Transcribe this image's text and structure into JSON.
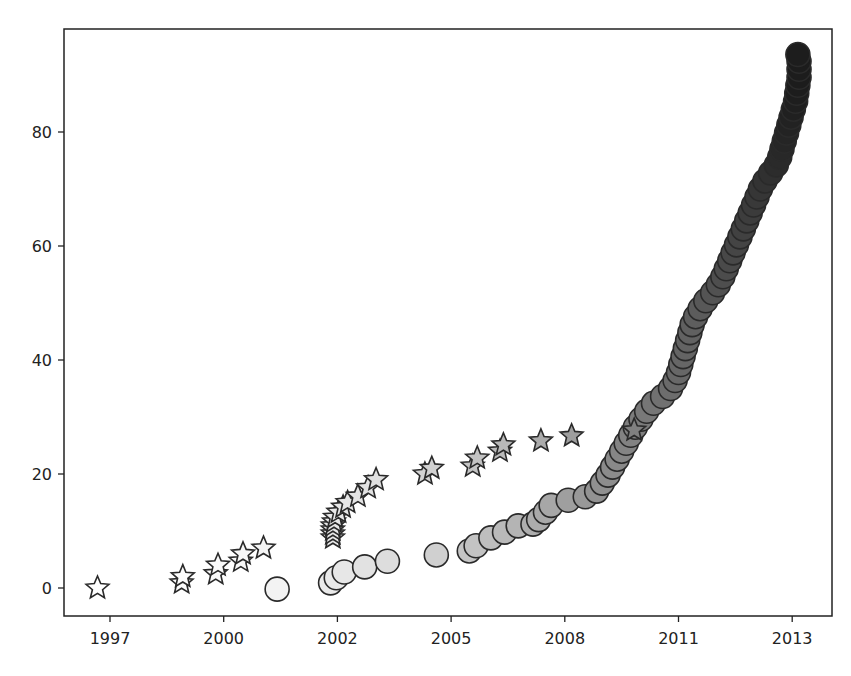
{
  "chart_data": {
    "type": "scatter",
    "title": "",
    "xlabel": "",
    "ylabel": "",
    "grid": false,
    "legend": null,
    "x_ticks": {
      "positions": [
        0,
        1,
        2,
        3,
        4,
        5,
        6
      ],
      "labels": [
        "1997",
        "2000",
        "2002",
        "2005",
        "2008",
        "2011",
        "2013"
      ]
    },
    "y_ticks": {
      "values": [
        0,
        20,
        40,
        60,
        80
      ],
      "labels": [
        "0",
        "20",
        "40",
        "60",
        "80"
      ]
    },
    "xlim": [
      -0.41,
      6.35
    ],
    "ylim": [
      -4.9,
      98.6
    ],
    "color_scale": "grayscale, light (early) to dark (late)",
    "series": [
      {
        "name": "stars",
        "marker": "star",
        "points": [
          [
            -0.11,
            0.0
          ],
          [
            0.63,
            0.9
          ],
          [
            0.64,
            2.0
          ],
          [
            0.93,
            2.5
          ],
          [
            0.95,
            4.0
          ],
          [
            1.15,
            4.7
          ],
          [
            1.17,
            6.0
          ],
          [
            1.35,
            7.0
          ],
          [
            1.96,
            8.8
          ],
          [
            1.96,
            9.5
          ],
          [
            1.96,
            10.2
          ],
          [
            1.96,
            10.9
          ],
          [
            1.97,
            11.6
          ],
          [
            1.98,
            12.4
          ],
          [
            2.01,
            13.3
          ],
          [
            2.05,
            14.2
          ],
          [
            2.09,
            15.0
          ],
          [
            2.18,
            16.1
          ],
          [
            2.27,
            17.6
          ],
          [
            2.34,
            19.0
          ],
          [
            2.77,
            20.0
          ],
          [
            2.83,
            21.0
          ],
          [
            3.19,
            21.4
          ],
          [
            3.23,
            22.8
          ],
          [
            3.43,
            24.0
          ],
          [
            3.46,
            25.1
          ],
          [
            3.79,
            25.8
          ],
          [
            4.06,
            26.7
          ],
          [
            4.61,
            27.7
          ]
        ]
      },
      {
        "name": "circles",
        "marker": "circle",
        "points": [
          [
            1.47,
            -0.2
          ],
          [
            1.94,
            0.9
          ],
          [
            1.99,
            1.8
          ],
          [
            2.06,
            2.8
          ],
          [
            2.24,
            3.7
          ],
          [
            2.44,
            4.7
          ],
          [
            2.87,
            5.8
          ],
          [
            3.16,
            6.5
          ],
          [
            3.22,
            7.4
          ],
          [
            3.35,
            8.8
          ],
          [
            3.47,
            9.8
          ],
          [
            3.59,
            10.9
          ],
          [
            3.72,
            11.2
          ],
          [
            3.77,
            12.0
          ],
          [
            3.83,
            13.3
          ],
          [
            3.88,
            14.5
          ],
          [
            4.03,
            15.4
          ],
          [
            4.18,
            16.0
          ],
          [
            4.28,
            17.0
          ],
          [
            4.33,
            18.4
          ],
          [
            4.38,
            19.8
          ],
          [
            4.42,
            21.2
          ],
          [
            4.46,
            22.6
          ],
          [
            4.5,
            24.0
          ],
          [
            4.54,
            25.4
          ],
          [
            4.58,
            26.8
          ],
          [
            4.62,
            28.2
          ],
          [
            4.67,
            29.6
          ],
          [
            4.72,
            31.0
          ],
          [
            4.78,
            32.4
          ],
          [
            4.86,
            33.6
          ],
          [
            4.93,
            35.0
          ],
          [
            4.97,
            36.4
          ],
          [
            5.0,
            37.8
          ],
          [
            5.02,
            39.2
          ],
          [
            5.04,
            40.6
          ],
          [
            5.06,
            42.0
          ],
          [
            5.08,
            43.4
          ],
          [
            5.1,
            44.8
          ],
          [
            5.12,
            46.2
          ],
          [
            5.15,
            47.6
          ],
          [
            5.19,
            49.0
          ],
          [
            5.24,
            50.4
          ],
          [
            5.3,
            51.8
          ],
          [
            5.35,
            53.2
          ],
          [
            5.39,
            54.6
          ],
          [
            5.42,
            56.0
          ],
          [
            5.45,
            57.4
          ],
          [
            5.48,
            58.8
          ],
          [
            5.51,
            60.2
          ],
          [
            5.54,
            61.6
          ],
          [
            5.57,
            63.0
          ],
          [
            5.6,
            64.4
          ],
          [
            5.63,
            65.8
          ],
          [
            5.66,
            67.2
          ],
          [
            5.69,
            68.6
          ],
          [
            5.72,
            70.0
          ],
          [
            5.76,
            71.4
          ],
          [
            5.81,
            72.8
          ],
          [
            5.86,
            74.2
          ],
          [
            5.89,
            75.6
          ],
          [
            5.91,
            77.0
          ],
          [
            5.93,
            78.4
          ],
          [
            5.95,
            79.8
          ],
          [
            5.97,
            81.2
          ],
          [
            5.99,
            82.6
          ],
          [
            6.01,
            84.0
          ],
          [
            6.03,
            85.4
          ],
          [
            6.04,
            86.8
          ],
          [
            6.05,
            88.2
          ],
          [
            6.06,
            89.6
          ],
          [
            6.06,
            91.0
          ],
          [
            6.06,
            92.4
          ],
          [
            6.05,
            93.6
          ]
        ]
      }
    ]
  }
}
